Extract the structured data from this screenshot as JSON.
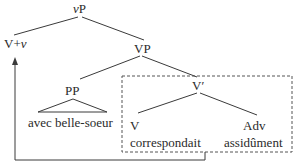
{
  "diagram": {
    "type": "syntax-tree",
    "nodes": {
      "root": {
        "label_italic": "v",
        "label_rest": "P"
      },
      "head": {
        "label_pre": "V+",
        "label_italic": "v"
      },
      "vp": {
        "label": "VP"
      },
      "pp": {
        "label": "PP",
        "terminal": "avec belle-soeur"
      },
      "vbar": {
        "label": "V′"
      },
      "v": {
        "label": "V",
        "terminal": "correspondait"
      },
      "adv": {
        "label": "Adv",
        "terminal": "assidûment"
      }
    },
    "movement": {
      "from": "correspondait",
      "to": "V+v"
    },
    "colors": {
      "ink": "#2a2a2a",
      "dash": "#555555"
    }
  }
}
